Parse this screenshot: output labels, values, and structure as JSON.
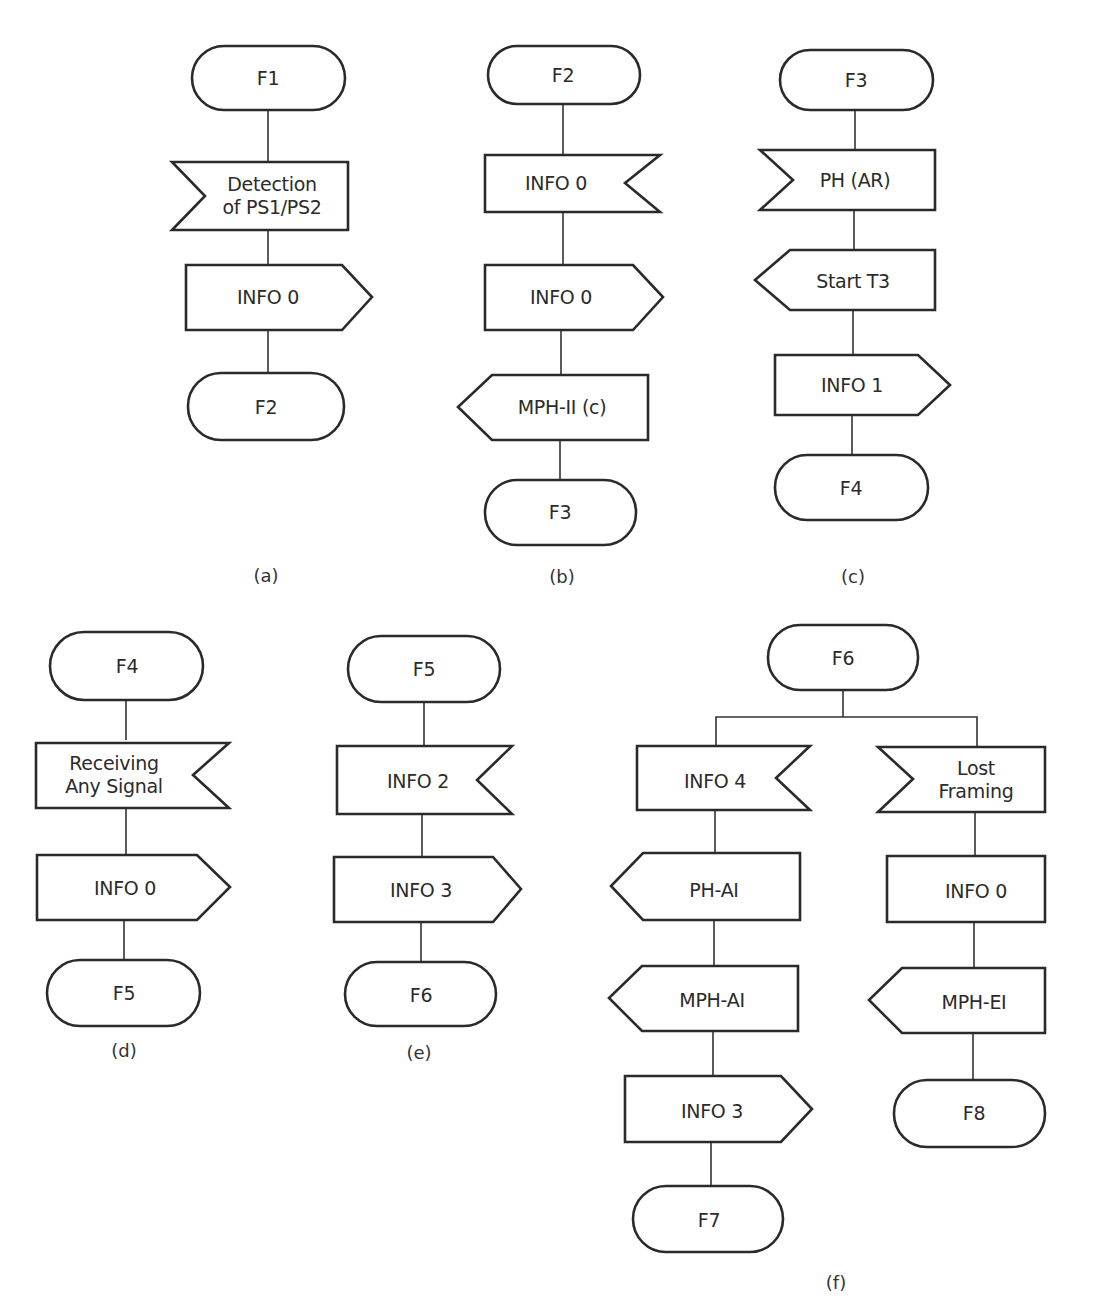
{
  "figure": {
    "panels": [
      {
        "id": "a",
        "caption": "(a)",
        "nodes": [
          {
            "type": "state",
            "label": "F1"
          },
          {
            "type": "receive",
            "label": "Detection\nof PS1/PS2"
          },
          {
            "type": "send",
            "label": "INFO 0"
          },
          {
            "type": "state",
            "label": "F2"
          }
        ]
      },
      {
        "id": "b",
        "caption": "(b)",
        "nodes": [
          {
            "type": "state",
            "label": "F2"
          },
          {
            "type": "receive",
            "label": "INFO 0"
          },
          {
            "type": "send",
            "label": "INFO 0"
          },
          {
            "type": "send-left",
            "label": "MPH-II (c)"
          },
          {
            "type": "state",
            "label": "F3"
          }
        ]
      },
      {
        "id": "c",
        "caption": "(c)",
        "nodes": [
          {
            "type": "state",
            "label": "F3"
          },
          {
            "type": "receive",
            "label": "PH (AR)"
          },
          {
            "type": "send-left",
            "label": "Start T3"
          },
          {
            "type": "send",
            "label": "INFO 1"
          },
          {
            "type": "state",
            "label": "F4"
          }
        ]
      },
      {
        "id": "d",
        "caption": "(d)",
        "nodes": [
          {
            "type": "state",
            "label": "F4"
          },
          {
            "type": "receive",
            "label": "Receiving\nAny Signal"
          },
          {
            "type": "send",
            "label": "INFO 0"
          },
          {
            "type": "state",
            "label": "F5"
          }
        ]
      },
      {
        "id": "e",
        "caption": "(e)",
        "nodes": [
          {
            "type": "state",
            "label": "F5"
          },
          {
            "type": "receive",
            "label": "INFO 2"
          },
          {
            "type": "send",
            "label": "INFO 3"
          },
          {
            "type": "state",
            "label": "F6"
          }
        ]
      },
      {
        "id": "f",
        "caption": "(f)",
        "root": {
          "type": "state",
          "label": "F6"
        },
        "branches": [
          {
            "nodes": [
              {
                "type": "receive",
                "label": "INFO 4"
              },
              {
                "type": "send-left",
                "label": "PH-AI"
              },
              {
                "type": "send-left",
                "label": "MPH-AI"
              },
              {
                "type": "send",
                "label": "INFO 3"
              },
              {
                "type": "state",
                "label": "F7"
              }
            ]
          },
          {
            "nodes": [
              {
                "type": "receive",
                "label": "Lost\nFraming"
              },
              {
                "type": "send",
                "label": "INFO 0"
              },
              {
                "type": "send-left",
                "label": "MPH-EI"
              },
              {
                "type": "state",
                "label": "F8"
              }
            ]
          }
        ]
      }
    ]
  }
}
